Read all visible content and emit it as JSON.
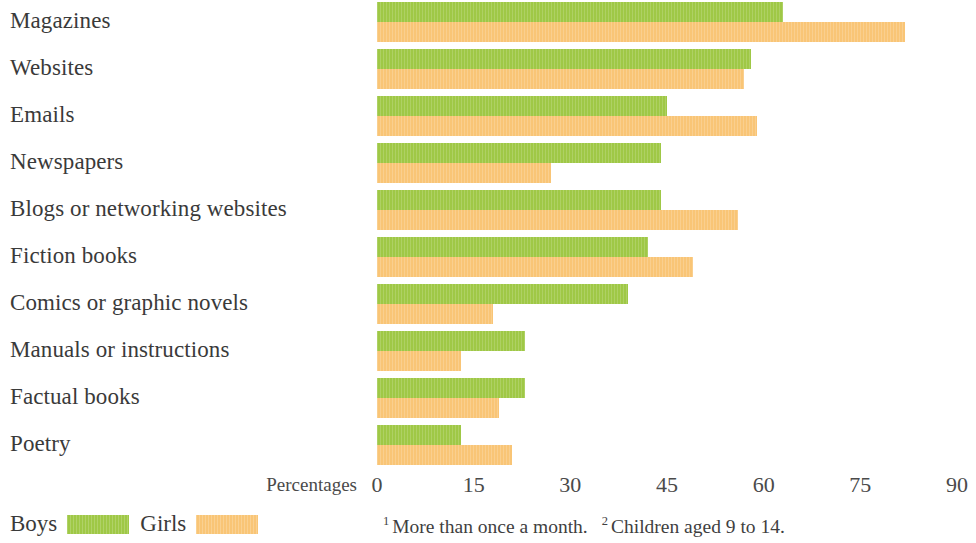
{
  "chart_data": {
    "type": "bar",
    "orientation": "horizontal",
    "title": "",
    "xlabel": "Percentages",
    "ylabel": "",
    "xlim": [
      0,
      90
    ],
    "xticks": [
      0,
      15,
      30,
      45,
      60,
      75,
      90
    ],
    "grid": false,
    "legend_position": "bottom-left",
    "categories": [
      "Magazines",
      "Websites",
      "Emails",
      "Newspapers",
      "Blogs or networking websites",
      "Fiction books",
      "Comics or graphic novels",
      "Manuals or instructions",
      "Factual books",
      "Poetry"
    ],
    "series": [
      {
        "name": "Boys",
        "color": "#9fc846",
        "values": [
          63,
          58,
          45,
          44,
          44,
          42,
          39,
          23,
          23,
          13
        ]
      },
      {
        "name": "Girls",
        "color": "#f9c576",
        "values": [
          82,
          57,
          59,
          27,
          56,
          49,
          18,
          13,
          19,
          21
        ]
      }
    ],
    "annotations": [
      "1 More than once a month.",
      "2 Children aged 9 to 14."
    ]
  },
  "axis": {
    "title": "Percentages",
    "ticks": [
      "0",
      "15",
      "30",
      "45",
      "60",
      "75",
      "90"
    ]
  },
  "legend": {
    "items": [
      {
        "label": "Boys",
        "color": "#9fc846"
      },
      {
        "label": "Girls",
        "color": "#f9c576"
      }
    ]
  },
  "notes": [
    {
      "marker": "1",
      "text": "More than once a month."
    },
    {
      "marker": "2",
      "text": "Children aged 9 to 14."
    }
  ]
}
